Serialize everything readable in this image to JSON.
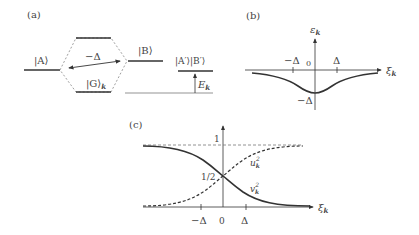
{
  "panel_a": {
    "label": "(a)",
    "state_A": "|A⟩",
    "state_B": "|B⟩",
    "state_G": "|G⟩",
    "state_G_sub": "k",
    "state_ApBp": "|A′⟩|B′⟩",
    "delta_label": "−Δ",
    "energy_label": "E",
    "energy_sub": "k"
  },
  "panel_b": {
    "label": "(b)",
    "y_axis_label": "ε",
    "y_axis_sub": "k",
    "x_axis_label": "ξ",
    "x_axis_sub": "k",
    "tick_neg": "−Δ",
    "tick_zero": "0",
    "tick_pos": "Δ",
    "min_label": "−Δ"
  },
  "panel_c": {
    "label": "(c)",
    "level_one": "1",
    "level_half": "1/2",
    "x_axis_label": "ξ",
    "x_axis_sub": "k",
    "tick_neg": "−Δ",
    "tick_zero": "0",
    "tick_pos": "Δ",
    "curve_u": "u",
    "curve_u_sub": "k",
    "curve_u_sup": "2",
    "curve_v": "v",
    "curve_v_sub": "k",
    "curve_v_sup": "2"
  },
  "colors": {
    "line": "#333333",
    "thin": "#666666",
    "dashed": "#777777"
  }
}
